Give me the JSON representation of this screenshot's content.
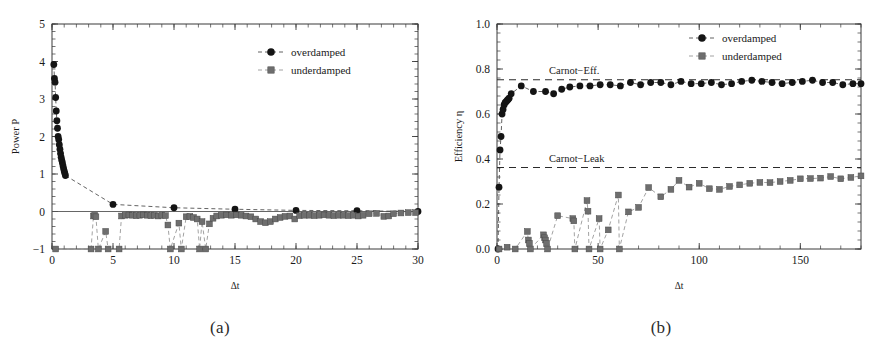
{
  "figure": {
    "panel_a_caption": "(a)",
    "panel_b_caption": "(b)"
  },
  "legend": {
    "overdamped": "overdamped",
    "underdamped": "underdamped"
  },
  "colors": {
    "overdamped": "#141414",
    "underdamped": "#6e6e6e",
    "axis": "#3a3a3a",
    "reference_line": "#2b2b2b",
    "background": "#ffffff"
  },
  "chart_data": [
    {
      "id": "panel-a",
      "type": "scatter",
      "title": "",
      "caption": "(a)",
      "xlabel": "Δt",
      "ylabel": "Power P",
      "xlim": [
        0,
        30
      ],
      "ylim": [
        -1,
        5
      ],
      "xticks": [
        0,
        5,
        10,
        15,
        20,
        25,
        30
      ],
      "xticklabels": [
        "0",
        "5",
        "10",
        "15",
        "20",
        "25",
        "30"
      ],
      "yticks": [
        -1,
        0,
        1,
        2,
        3,
        4,
        5
      ],
      "yticklabels": [
        "−1",
        "0",
        "1",
        "2",
        "3",
        "4",
        "5"
      ],
      "grid": false,
      "legend_position": "top-right",
      "zero_line": 0,
      "series": [
        {
          "name": "overdamped",
          "marker": "circle",
          "connector": "dashed",
          "x": [
            0.15,
            0.2,
            0.25,
            0.3,
            0.35,
            0.4,
            0.45,
            0.5,
            0.55,
            0.6,
            0.65,
            0.7,
            0.75,
            0.8,
            0.85,
            0.9,
            0.95,
            1.0,
            1.05,
            1.1,
            5.0,
            10.0,
            15.0,
            20.0,
            25.0,
            30.0
          ],
          "y": [
            3.92,
            3.55,
            3.45,
            3.04,
            2.68,
            2.42,
            2.22,
            2.0,
            1.92,
            1.78,
            1.66,
            1.55,
            1.45,
            1.37,
            1.3,
            1.22,
            1.15,
            1.08,
            1.02,
            0.96,
            0.19,
            0.1,
            0.06,
            0.03,
            0.02,
            0.0
          ]
        },
        {
          "name": "underdamped",
          "marker": "square",
          "connector": "dashed",
          "x": [
            0.3,
            3.2,
            3.4,
            3.5,
            3.6,
            3.8,
            4.4,
            4.6,
            5.5,
            5.7,
            6.0,
            6.3,
            6.6,
            6.9,
            7.2,
            7.5,
            7.8,
            8.1,
            8.4,
            8.7,
            9.0,
            9.3,
            9.5,
            9.7,
            10.4,
            10.6,
            11.0,
            11.3,
            11.6,
            11.9,
            12.1,
            12.3,
            12.6,
            12.9,
            13.2,
            13.5,
            13.9,
            14.3,
            14.7,
            15.1,
            15.5,
            15.9,
            16.3,
            16.7,
            17.1,
            17.5,
            17.9,
            18.3,
            18.7,
            19.1,
            19.5,
            19.9,
            20.3,
            20.7,
            21.1,
            21.5,
            21.9,
            22.3,
            22.7,
            23.1,
            23.5,
            23.9,
            24.3,
            24.7,
            25.1,
            25.5,
            26.0,
            26.6,
            27.2,
            27.6,
            28.0,
            28.6,
            29.2,
            29.8
          ],
          "y": [
            -1.0,
            -1.0,
            -0.12,
            -0.1,
            -0.14,
            -1.0,
            -0.53,
            -1.0,
            -1.0,
            -0.12,
            -0.1,
            -0.09,
            -0.1,
            -0.11,
            -0.1,
            -0.09,
            -0.1,
            -0.11,
            -0.1,
            -0.12,
            -0.1,
            -0.11,
            -0.36,
            -1.0,
            -0.31,
            -1.0,
            -0.14,
            -0.13,
            -0.16,
            -0.2,
            -1.0,
            -0.27,
            -1.0,
            -0.33,
            -0.18,
            -0.12,
            -0.1,
            -0.09,
            -0.1,
            -0.09,
            -0.1,
            -0.12,
            -0.14,
            -0.2,
            -0.27,
            -0.3,
            -0.27,
            -0.2,
            -0.16,
            -0.13,
            -0.12,
            -0.2,
            -0.11,
            -0.1,
            -0.1,
            -0.11,
            -0.1,
            -0.09,
            -0.1,
            -0.11,
            -0.1,
            -0.1,
            -0.11,
            -0.1,
            -0.12,
            -0.1,
            -0.06,
            -0.05,
            -0.13,
            -0.12,
            -0.06,
            -0.04,
            -0.03,
            -0.03
          ]
        }
      ]
    },
    {
      "id": "panel-b",
      "type": "scatter",
      "title": "",
      "caption": "(b)",
      "xlabel": "Δt",
      "ylabel": "Efficiency η",
      "xlim": [
        0,
        180
      ],
      "ylim": [
        0.0,
        1.0
      ],
      "xticks": [
        0,
        50,
        100,
        150
      ],
      "xticklabels": [
        "0",
        "50",
        "100",
        "150"
      ],
      "yticks": [
        0.0,
        0.2,
        0.4,
        0.6,
        0.8,
        1.0
      ],
      "yticklabels": [
        "0.0",
        "0.2",
        "0.4",
        "0.6",
        "0.8",
        "1.0"
      ],
      "grid": false,
      "legend_position": "top-right",
      "annotations": [
        {
          "label": "Carnot−Eff.",
          "y": 0.752,
          "style": "dashed"
        },
        {
          "label": "Carnot−Leak",
          "y": 0.362,
          "style": "dashed"
        }
      ],
      "series": [
        {
          "name": "overdamped",
          "marker": "circle",
          "connector": "dashed",
          "x": [
            0.5,
            1,
            1.5,
            2,
            2.5,
            3,
            3.5,
            4,
            4.5,
            5,
            5.5,
            6,
            7,
            12,
            18,
            24,
            28,
            32,
            36,
            41,
            46,
            51,
            56,
            61,
            66,
            71,
            76,
            81,
            86,
            91,
            96,
            101,
            106,
            111,
            116,
            121,
            126,
            131,
            136,
            141,
            146,
            151,
            156,
            161,
            166,
            171,
            176,
            180
          ],
          "y": [
            0.0,
            0.275,
            0.44,
            0.5,
            0.6,
            0.62,
            0.64,
            0.65,
            0.655,
            0.66,
            0.665,
            0.67,
            0.69,
            0.725,
            0.7,
            0.7,
            0.69,
            0.71,
            0.72,
            0.725,
            0.725,
            0.73,
            0.73,
            0.725,
            0.74,
            0.73,
            0.74,
            0.74,
            0.73,
            0.745,
            0.735,
            0.735,
            0.74,
            0.73,
            0.735,
            0.745,
            0.75,
            0.745,
            0.74,
            0.735,
            0.74,
            0.745,
            0.75,
            0.74,
            0.74,
            0.73,
            0.735,
            0.735
          ]
        },
        {
          "name": "underdamped",
          "marker": "square",
          "connector": "dashed",
          "x": [
            1,
            5,
            9,
            15,
            15.5,
            16,
            16.5,
            23,
            23.5,
            24,
            24.5,
            25,
            30,
            37.5,
            38,
            38.5,
            44.5,
            45,
            45.5,
            50.5,
            51,
            55,
            60,
            60.5,
            65,
            70,
            75,
            81,
            86,
            90,
            95,
            100,
            105,
            110,
            115,
            120,
            125,
            130,
            135,
            140,
            145,
            150,
            155,
            160,
            165,
            170,
            175,
            180
          ],
          "y": [
            0.0,
            0.008,
            0.0,
            0.078,
            0.04,
            0.025,
            0.0,
            0.063,
            0.05,
            0.04,
            0.025,
            0.0,
            0.148,
            0.135,
            0.125,
            0.0,
            0.215,
            0.168,
            0.0,
            0.135,
            0.0,
            0.085,
            0.24,
            0.0,
            0.165,
            0.185,
            0.273,
            0.232,
            0.265,
            0.305,
            0.275,
            0.292,
            0.268,
            0.265,
            0.278,
            0.285,
            0.292,
            0.296,
            0.295,
            0.3,
            0.305,
            0.312,
            0.313,
            0.315,
            0.322,
            0.312,
            0.318,
            0.325
          ]
        }
      ]
    }
  ]
}
